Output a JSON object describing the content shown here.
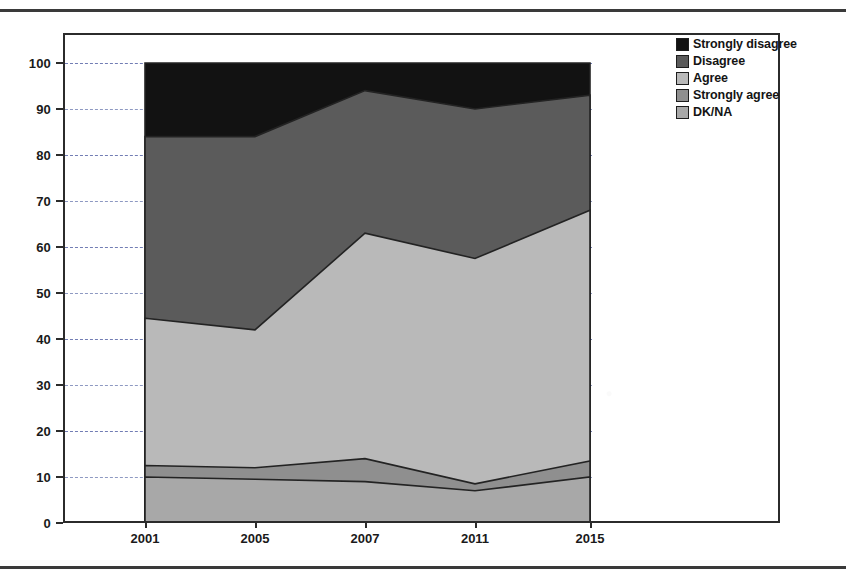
{
  "legend": {
    "position": "top-right",
    "items": [
      {
        "label": "Strongly disagree",
        "color": "#121212"
      },
      {
        "label": "Disagree",
        "color": "#5b5b5b"
      },
      {
        "label": "Agree",
        "color": "#b9b9b9"
      },
      {
        "label": "Strongly agree",
        "color": "#8f8f8f"
      },
      {
        "label": "DK/NA",
        "color": "#a8a8a8"
      }
    ]
  },
  "axes": {
    "y_ticks": [
      "0",
      "10",
      "20",
      "30",
      "40",
      "50",
      "60",
      "70",
      "80",
      "90",
      "100"
    ],
    "x_ticks": [
      "2001",
      "2005",
      "2007",
      "2011",
      "2015"
    ]
  },
  "chart_data": {
    "type": "area",
    "title": "",
    "xlabel": "",
    "ylabel": "",
    "ylim": [
      0,
      100
    ],
    "xlim": [
      "2001",
      "2015"
    ],
    "grid": true,
    "stacked": true,
    "legend_position": "top-right",
    "x": [
      "2001",
      "2005",
      "2007",
      "2011",
      "2015"
    ],
    "series": [
      {
        "name": "DK/NA",
        "color": "#a8a8a8",
        "values": [
          10.0,
          9.5,
          9.0,
          7.0,
          10.0
        ]
      },
      {
        "name": "Strongly agree",
        "color": "#8f8f8f",
        "values": [
          2.5,
          2.5,
          5.0,
          1.5,
          3.5
        ]
      },
      {
        "name": "Agree",
        "color": "#b9b9b9",
        "values": [
          32.0,
          30.0,
          49.0,
          49.0,
          54.5
        ]
      },
      {
        "name": "Disagree",
        "color": "#5b5b5b",
        "values": [
          39.5,
          42.0,
          31.0,
          32.5,
          25.0
        ]
      },
      {
        "name": "Strongly disagree",
        "color": "#121212",
        "values": [
          16.0,
          16.0,
          6.0,
          10.0,
          7.0
        ]
      }
    ],
    "cumulative_tops": {
      "DK/NA": [
        10.0,
        9.5,
        9.0,
        7.0,
        10.0
      ],
      "Strongly agree": [
        12.5,
        12.0,
        14.0,
        8.5,
        13.5
      ],
      "Agree": [
        44.5,
        42.0,
        63.0,
        57.5,
        68.0
      ],
      "Disagree": [
        84.0,
        84.0,
        94.0,
        90.0,
        93.0
      ],
      "Strongly disagree": [
        100.0,
        100.0,
        100.0,
        100.0,
        100.0
      ]
    }
  }
}
